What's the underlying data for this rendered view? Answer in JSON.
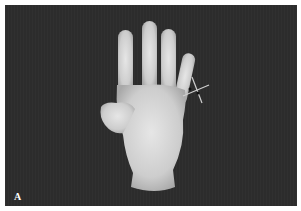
{
  "figure": {
    "panel_label": "A",
    "marker": "cross-marker",
    "colors": {
      "background": "#2c2c2c",
      "border": "#ffffff",
      "hand": "#d8d8d8",
      "marker": "#cfcfcf"
    }
  }
}
